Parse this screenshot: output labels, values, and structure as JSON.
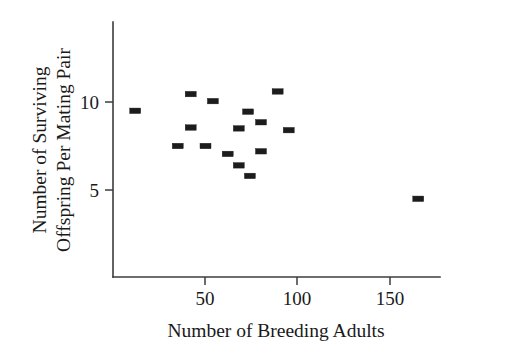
{
  "chart_data": {
    "type": "scatter",
    "title": "",
    "xlabel": "Number of Breeding Adults",
    "ylabel_line1": "Number of Surviving",
    "ylabel_line2": "Offspring Per Mating Pair",
    "ylabel": "Number of Surviving Offspring Per Mating Pair",
    "xlim": [
      0,
      178
    ],
    "ylim": [
      0,
      11.6
    ],
    "xticks": [
      50,
      100,
      150
    ],
    "yticks": [
      5,
      10
    ],
    "xtick_labels": [
      "50",
      "100",
      "150"
    ],
    "ytick_labels": [
      "5",
      "10"
    ],
    "grid": false,
    "legend": false,
    "marker_style": "filled-rectangle",
    "marker_color": "#1c1c1c",
    "axis_color": "#3c3c3c",
    "points": [
      {
        "x": 12,
        "y": 9.5
      },
      {
        "x": 42,
        "y": 10.45
      },
      {
        "x": 42,
        "y": 8.55
      },
      {
        "x": 35,
        "y": 7.5
      },
      {
        "x": 54,
        "y": 10.05
      },
      {
        "x": 50,
        "y": 7.5
      },
      {
        "x": 62,
        "y": 7.05
      },
      {
        "x": 68,
        "y": 8.5
      },
      {
        "x": 68,
        "y": 6.4
      },
      {
        "x": 73,
        "y": 9.45
      },
      {
        "x": 74,
        "y": 5.8
      },
      {
        "x": 80,
        "y": 8.85
      },
      {
        "x": 80,
        "y": 7.2
      },
      {
        "x": 89,
        "y": 10.6
      },
      {
        "x": 95,
        "y": 8.4
      },
      {
        "x": 165,
        "y": 4.5
      }
    ]
  },
  "axes": {
    "x_axis_name": "x-axis",
    "y_axis_name": "y-axis"
  }
}
